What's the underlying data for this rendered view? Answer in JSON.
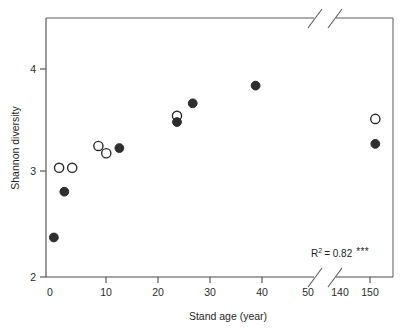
{
  "chart_data": {
    "type": "scatter",
    "title": "",
    "xlabel": "Stand age (year)",
    "ylabel": "Shannon diversity",
    "xlim": [
      0,
      155
    ],
    "ylim": [
      2,
      4.45
    ],
    "grid": false,
    "legend": "none",
    "x_ticks": [
      0,
      10,
      20,
      30,
      40,
      50,
      140,
      150
    ],
    "x_tick_labels": [
      "0",
      "10",
      "20",
      "30",
      "40",
      "50",
      "140",
      "150"
    ],
    "y_ticks": [
      2,
      3,
      4
    ],
    "y_tick_labels": [
      "2",
      "3",
      "4"
    ],
    "axis_break": {
      "axis": "x",
      "from": 50,
      "to": 140,
      "style": "double-slash"
    },
    "annotations": [
      {
        "name": "r-squared",
        "text": "R2 = 0.82 ***",
        "r_symbol": "R",
        "exponent": "2",
        "equals_value": "= 0.82",
        "significance": "***",
        "x": 140,
        "y": 2.26
      }
    ],
    "series": [
      {
        "name": "open-circles",
        "marker": "open-circle",
        "color": "#2b2b2b",
        "points": [
          {
            "x": 2.5,
            "y": 3.05
          },
          {
            "x": 5.0,
            "y": 3.05
          },
          {
            "x": 10.0,
            "y": 3.26
          },
          {
            "x": 11.5,
            "y": 3.19
          },
          {
            "x": 25.0,
            "y": 3.55
          },
          {
            "x": 150.0,
            "y": 3.52
          }
        ]
      },
      {
        "name": "filled-circles",
        "marker": "filled-circle",
        "color": "#2e2e2e",
        "points": [
          {
            "x": 1.5,
            "y": 2.38
          },
          {
            "x": 3.5,
            "y": 2.82
          },
          {
            "x": 14.0,
            "y": 3.24
          },
          {
            "x": 25.0,
            "y": 3.49
          },
          {
            "x": 28.0,
            "y": 3.67
          },
          {
            "x": 40.0,
            "y": 3.84
          },
          {
            "x": 150.0,
            "y": 3.28
          }
        ]
      }
    ]
  },
  "figure": {
    "background": "#ffffff",
    "axis_color": "#4a4a4a",
    "marker_color": "#2e2e2e"
  }
}
